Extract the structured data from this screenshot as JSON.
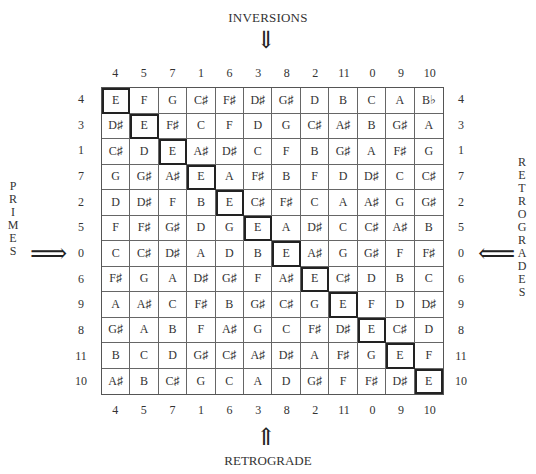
{
  "labels": {
    "top": "INVERSIONS",
    "bottom": "RETROGRADE",
    "left": [
      "P",
      "R",
      "I",
      "M",
      "E",
      "S"
    ],
    "right": [
      "R",
      "E",
      "T",
      "R",
      "O",
      "G",
      "R",
      "A",
      "D",
      "E",
      "S"
    ]
  },
  "arrows": {
    "down": "⇓",
    "up": "⇑",
    "right": "⟹",
    "left": "⟸"
  },
  "column_numbers": [
    "4",
    "5",
    "7",
    "1",
    "6",
    "3",
    "8",
    "2",
    "11",
    "0",
    "9",
    "10"
  ],
  "row_numbers": [
    "4",
    "3",
    "1",
    "7",
    "2",
    "5",
    "0",
    "6",
    "9",
    "8",
    "11",
    "10"
  ],
  "matrix": [
    [
      "E",
      "F",
      "G",
      "C♯",
      "F♯",
      "D♯",
      "G♯",
      "D",
      "B",
      "C",
      "A",
      "B♭"
    ],
    [
      "D♯",
      "E",
      "F♯",
      "C",
      "F",
      "D",
      "G",
      "C♯",
      "A♯",
      "B",
      "G♯",
      "A"
    ],
    [
      "C♯",
      "D",
      "E",
      "A♯",
      "D♯",
      "C",
      "F",
      "B",
      "G♯",
      "A",
      "F♯",
      "G"
    ],
    [
      "G",
      "G♯",
      "A♯",
      "E",
      "A",
      "F♯",
      "B",
      "F",
      "D",
      "D♯",
      "C",
      "C♯"
    ],
    [
      "D",
      "D♯",
      "F",
      "B",
      "E",
      "C♯",
      "F♯",
      "C",
      "A",
      "A♯",
      "G",
      "G♯"
    ],
    [
      "F",
      "F♯",
      "G♯",
      "D",
      "G",
      "E",
      "A",
      "D♯",
      "C",
      "C♯",
      "A♯",
      "B"
    ],
    [
      "C",
      "C♯",
      "D♯",
      "A",
      "D",
      "B",
      "E",
      "A♯",
      "G",
      "G♯",
      "F",
      "F♯"
    ],
    [
      "F♯",
      "G",
      "A",
      "D♯",
      "G♯",
      "F",
      "A♯",
      "E",
      "C♯",
      "D",
      "B",
      "C"
    ],
    [
      "A",
      "A♯",
      "C",
      "F♯",
      "B",
      "G♯",
      "C♯",
      "G",
      "E",
      "F",
      "D",
      "D♯"
    ],
    [
      "G♯",
      "A",
      "B",
      "F",
      "A♯",
      "G",
      "C",
      "F♯",
      "D♯",
      "E",
      "C♯",
      "D"
    ],
    [
      "B",
      "C",
      "D",
      "G♯",
      "C♯",
      "A♯",
      "D♯",
      "A",
      "F♯",
      "G",
      "E",
      "F"
    ],
    [
      "A♯",
      "B",
      "C♯",
      "G",
      "C",
      "A",
      "D",
      "G♯",
      "F",
      "F♯",
      "D♯",
      "E"
    ]
  ]
}
